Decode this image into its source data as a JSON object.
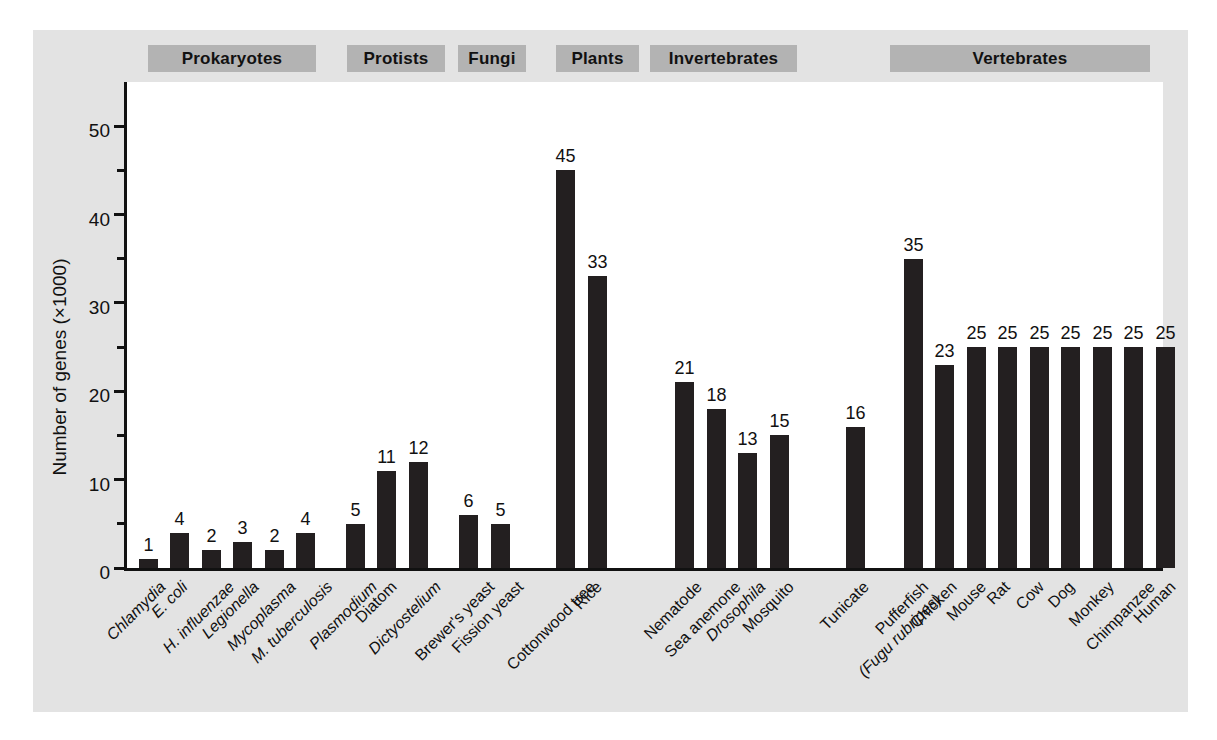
{
  "chart_data": {
    "type": "bar",
    "title": "",
    "xlabel": "",
    "ylabel": "Number of genes (×1000)",
    "ylim": [
      0,
      55
    ],
    "yticks": [
      0,
      10,
      20,
      30,
      40,
      50
    ],
    "yticklabels": [
      "0",
      "10",
      "20",
      "30",
      "40",
      "50"
    ],
    "yminorticks": [
      5,
      15,
      25,
      35,
      45
    ],
    "grid": false,
    "legend": "none",
    "bar_color": "#231f20",
    "panel_color": "#e3e3e3",
    "band_color": "#b3b3b3",
    "groups": [
      {
        "name": "Prokaryotes",
        "label": "Prokaryotes"
      },
      {
        "name": "Protists",
        "label": "Protists"
      },
      {
        "name": "Fungi",
        "label": "Fungi"
      },
      {
        "name": "Plants",
        "label": "Plants"
      },
      {
        "name": "Invertebrates",
        "label": "Invertebrates"
      },
      {
        "name": "Vertebrates",
        "label": "Vertebrates"
      }
    ],
    "categories": [
      "Chlamydia",
      "E. coli",
      "H. influenzae",
      "Legionella",
      "Mycoplasma",
      "M. tuberculosis",
      "Plasmodium",
      "Diatom",
      "Dictyostelium",
      "Brewer's yeast",
      "Fission yeast",
      "Cottonwood tree",
      "Rice",
      "Nematode",
      "Sea anemone",
      "Drosophila",
      "Mosquito",
      "Tunicate",
      "Pufferfish (Fugu rubripes)",
      "Chicken",
      "Mouse",
      "Rat",
      "Cow",
      "Dog",
      "Monkey",
      "Chimpanzee",
      "Human"
    ],
    "values": [
      1,
      4,
      2,
      3,
      2,
      4,
      5,
      11,
      12,
      6,
      5,
      45,
      33,
      21,
      18,
      13,
      15,
      16,
      35,
      23,
      25,
      25,
      25,
      25,
      25,
      25,
      25
    ],
    "bars": [
      {
        "label": "Chlamydia",
        "label_line2": "",
        "italic": true,
        "value": 1,
        "group": "Prokaryotes"
      },
      {
        "label": "E. coli",
        "label_line2": "",
        "italic": true,
        "value": 4,
        "group": "Prokaryotes"
      },
      {
        "label": "H. influenzae",
        "label_line2": "",
        "italic": true,
        "value": 2,
        "group": "Prokaryotes"
      },
      {
        "label": "Legionella",
        "label_line2": "",
        "italic": true,
        "value": 3,
        "group": "Prokaryotes"
      },
      {
        "label": "Mycoplasma",
        "label_line2": "",
        "italic": true,
        "value": 2,
        "group": "Prokaryotes"
      },
      {
        "label": "M. tuberculosis",
        "label_line2": "",
        "italic": true,
        "value": 4,
        "group": "Prokaryotes"
      },
      {
        "label": "Plasmodium",
        "label_line2": "",
        "italic": true,
        "value": 5,
        "group": "Protists"
      },
      {
        "label": "Diatom",
        "label_line2": "",
        "italic": false,
        "value": 11,
        "group": "Protists"
      },
      {
        "label": "Dictyostelium",
        "label_line2": "",
        "italic": true,
        "value": 12,
        "group": "Protists"
      },
      {
        "label": "Brewer's yeast",
        "label_line2": "",
        "italic": false,
        "value": 6,
        "group": "Fungi"
      },
      {
        "label": "Fission yeast",
        "label_line2": "",
        "italic": false,
        "value": 5,
        "group": "Fungi"
      },
      {
        "label": "Cottonwood tree",
        "label_line2": "",
        "italic": false,
        "value": 45,
        "group": "Plants"
      },
      {
        "label": "Rice",
        "label_line2": "",
        "italic": false,
        "value": 33,
        "group": "Plants"
      },
      {
        "label": "Nematode",
        "label_line2": "",
        "italic": false,
        "value": 21,
        "group": "Invertebrates"
      },
      {
        "label": "Sea anemone",
        "label_line2": "",
        "italic": false,
        "value": 18,
        "group": "Invertebrates"
      },
      {
        "label": "Drosophila",
        "label_line2": "",
        "italic": true,
        "value": 13,
        "group": "Invertebrates"
      },
      {
        "label": "Mosquito",
        "label_line2": "",
        "italic": false,
        "value": 15,
        "group": "Invertebrates"
      },
      {
        "label": "Tunicate",
        "label_line2": "",
        "italic": false,
        "value": 16,
        "group": "Vertebrates"
      },
      {
        "label": "Pufferfish",
        "label_line2": "(Fugu rubripes)",
        "italic": false,
        "value": 35,
        "group": "Vertebrates"
      },
      {
        "label": "Chicken",
        "label_line2": "",
        "italic": false,
        "value": 23,
        "group": "Vertebrates"
      },
      {
        "label": "Mouse",
        "label_line2": "",
        "italic": false,
        "value": 25,
        "group": "Vertebrates"
      },
      {
        "label": "Rat",
        "label_line2": "",
        "italic": false,
        "value": 25,
        "group": "Vertebrates"
      },
      {
        "label": "Cow",
        "label_line2": "",
        "italic": false,
        "value": 25,
        "group": "Vertebrates"
      },
      {
        "label": "Dog",
        "label_line2": "",
        "italic": false,
        "value": 25,
        "group": "Vertebrates"
      },
      {
        "label": "Monkey",
        "label_line2": "",
        "italic": false,
        "value": 25,
        "group": "Vertebrates"
      },
      {
        "label": "Chimpanzee",
        "label_line2": "",
        "italic": false,
        "value": 25,
        "group": "Vertebrates"
      },
      {
        "label": "Human",
        "label_line2": "",
        "italic": false,
        "value": 25,
        "group": "Vertebrates"
      }
    ]
  },
  "layout": {
    "bands": [
      {
        "label": "Prokaryotes",
        "left": 148,
        "width": 168
      },
      {
        "label": "Protists",
        "left": 347,
        "width": 98
      },
      {
        "label": "Fungi",
        "left": 458,
        "width": 68
      },
      {
        "label": "Plants",
        "left": 556,
        "width": 83
      },
      {
        "label": "Invertebrates",
        "left": 650,
        "width": 147
      },
      {
        "label": "Vertebrates",
        "left": 890,
        "width": 260
      }
    ],
    "bar_positions": [
      {
        "x": 136,
        "w": 19
      },
      {
        "x": 167,
        "w": 19
      },
      {
        "x": 199,
        "w": 19
      },
      {
        "x": 230,
        "w": 19
      },
      {
        "x": 262,
        "w": 19
      },
      {
        "x": 293,
        "w": 19
      },
      {
        "x": 343,
        "w": 19
      },
      {
        "x": 374,
        "w": 19
      },
      {
        "x": 406,
        "w": 19
      },
      {
        "x": 456,
        "w": 19
      },
      {
        "x": 488,
        "w": 19
      },
      {
        "x": 553,
        "w": 19
      },
      {
        "x": 585,
        "w": 19
      },
      {
        "x": 672,
        "w": 19
      },
      {
        "x": 704,
        "w": 19
      },
      {
        "x": 735,
        "w": 19
      },
      {
        "x": 767,
        "w": 19
      },
      {
        "x": 843,
        "w": 19
      },
      {
        "x": 901,
        "w": 19
      },
      {
        "x": 932,
        "w": 19
      },
      {
        "x": 964,
        "w": 19
      },
      {
        "x": 995,
        "w": 19
      },
      {
        "x": 1027,
        "w": 19
      },
      {
        "x": 1058,
        "w": 19
      },
      {
        "x": 1090,
        "w": 19
      },
      {
        "x": 1121,
        "w": 19
      },
      {
        "x": 1153,
        "w": 19
      }
    ]
  }
}
